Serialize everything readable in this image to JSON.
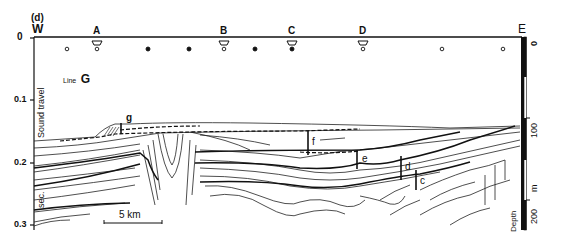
{
  "figure": {
    "panel_label": "(d)",
    "line_label_prefix": "Line",
    "line_label_letter": "G",
    "west_label": "W",
    "east_label": "E",
    "stations": [
      {
        "label": "A",
        "x": 97
      },
      {
        "label": "B",
        "x": 224
      },
      {
        "label": "C",
        "x": 292
      },
      {
        "label": "D",
        "x": 363
      }
    ],
    "markers": [
      {
        "type": "open",
        "x": 67
      },
      {
        "type": "open",
        "x": 97
      },
      {
        "type": "filled",
        "x": 148
      },
      {
        "type": "filled",
        "x": 189
      },
      {
        "type": "open",
        "x": 224
      },
      {
        "type": "filled",
        "x": 255
      },
      {
        "type": "filled",
        "x": 292
      },
      {
        "type": "open",
        "x": 363
      },
      {
        "type": "open",
        "x": 442
      },
      {
        "type": "open",
        "x": 503
      }
    ],
    "time_axis": {
      "title": "Sound travel",
      "unit": "sec.",
      "ticks": [
        {
          "label": "0",
          "y": 38
        },
        {
          "label": "0.1",
          "y": 100
        },
        {
          "label": "0.2",
          "y": 163
        },
        {
          "label": "0.3",
          "y": 225
        }
      ]
    },
    "depth_axis": {
      "title": "Depth",
      "unit": "m",
      "ticks": [
        {
          "label": "0",
          "y": 38
        },
        {
          "label": "100",
          "y": 118
        },
        {
          "label": "200",
          "y": 200
        }
      ]
    },
    "scale_bar": {
      "label": "5 km"
    },
    "thickness_markers": [
      {
        "label": "g"
      },
      {
        "label": "f"
      },
      {
        "label": "e"
      },
      {
        "label": "d"
      },
      {
        "label": "c"
      }
    ]
  }
}
